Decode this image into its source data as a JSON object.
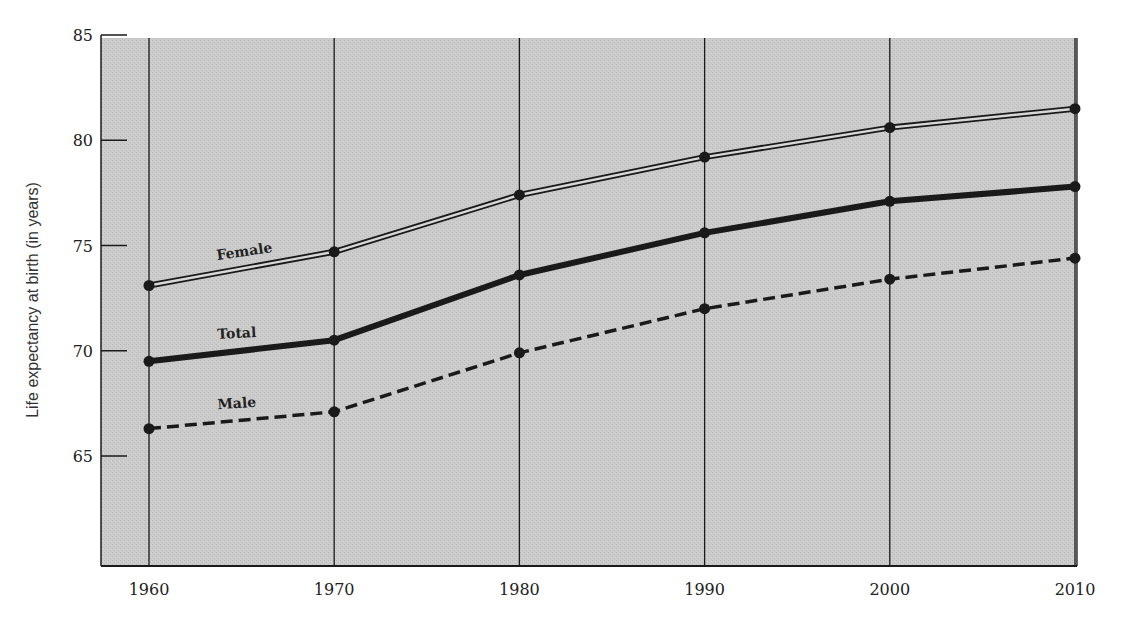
{
  "chart_data": {
    "type": "line",
    "title": "",
    "xlabel": "",
    "ylabel": "Life expectancy at birth (in years)",
    "x": [
      1960,
      1970,
      1980,
      1990,
      2000,
      2010
    ],
    "x_tick_labels": [
      "1960",
      "1970",
      "1980",
      "1990",
      "2000",
      "2010"
    ],
    "y_ticks": [
      65,
      70,
      75,
      80,
      85
    ],
    "y_tick_labels": [
      "65",
      "70",
      "75",
      "80",
      "85"
    ],
    "ylim": [
      61,
      85
    ],
    "grid": "vertical lines at each decade",
    "legend": "inline labels on lines",
    "series": [
      {
        "name": "Female",
        "style": "double line",
        "values": [
          73.1,
          74.7,
          77.4,
          79.2,
          80.6,
          81.5
        ]
      },
      {
        "name": "Total",
        "style": "thick solid",
        "values": [
          69.5,
          70.5,
          73.6,
          75.6,
          77.1,
          77.8
        ]
      },
      {
        "name": "Male",
        "style": "dashed",
        "values": [
          66.3,
          67.1,
          69.9,
          72.0,
          73.4,
          74.4
        ]
      }
    ],
    "colors": {
      "plot_background": "#c8c8c8",
      "line": "#1a1a1a",
      "page_background": "#ffffff"
    }
  }
}
